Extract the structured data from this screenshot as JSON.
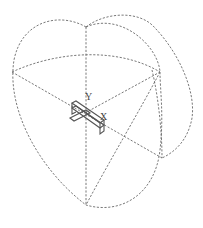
{
  "viewport": {
    "type": "3d-cad-viewport",
    "view_gizmo": "orbit-wireframe",
    "line_color": "#6a6a6a",
    "background": "#ffffff"
  },
  "axes": {
    "y_label": "Y",
    "x_label": "X"
  },
  "model": {
    "name": "bracket-part"
  }
}
